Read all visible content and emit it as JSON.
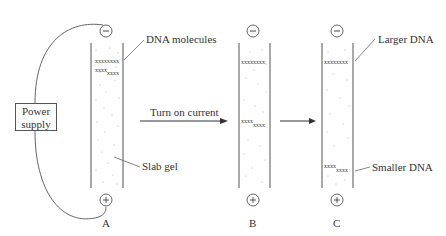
{
  "figure": {
    "power_supply": {
      "line1": "Power",
      "line2": "supply"
    },
    "labels": {
      "dna_molecules": "DNA molecules",
      "slab_gel": "Slab gel",
      "turn_on_current": "Turn on current",
      "larger_dna": "Larger DNA",
      "smaller_dna": "Smaller DNA"
    },
    "panels": [
      {
        "id": "A",
        "label": "A"
      },
      {
        "id": "B",
        "label": "B"
      },
      {
        "id": "C",
        "label": "C"
      }
    ],
    "electrodes": {
      "negative": "−",
      "positive": "+"
    }
  }
}
